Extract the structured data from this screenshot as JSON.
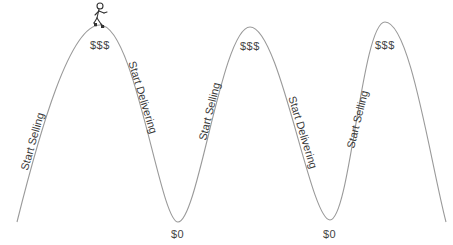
{
  "diagram": {
    "title": "",
    "colors": {
      "curve": "#9a9a9a",
      "text": "#3a3a3a",
      "background": "#ffffff"
    },
    "peaks": [
      {
        "label": "$$$",
        "x": 100,
        "y": 25
      },
      {
        "label": "$$$",
        "x": 250,
        "y": 27
      },
      {
        "label": "$$$",
        "x": 385,
        "y": 22
      }
    ],
    "troughs": [
      {
        "label": "$0",
        "x": 178,
        "y": 222
      },
      {
        "label": "$0",
        "x": 330,
        "y": 220
      }
    ],
    "slope_labels": [
      {
        "text": "Start Selling",
        "phase": "rising"
      },
      {
        "text": "Start Delivering",
        "phase": "falling"
      },
      {
        "text": "Start Selling",
        "phase": "rising"
      },
      {
        "text": "Start Delivering",
        "phase": "falling"
      },
      {
        "text": "Start Selling",
        "phase": "rising"
      }
    ],
    "figure": {
      "icon": "stick-figure-walking",
      "position": "top of first peak"
    }
  }
}
